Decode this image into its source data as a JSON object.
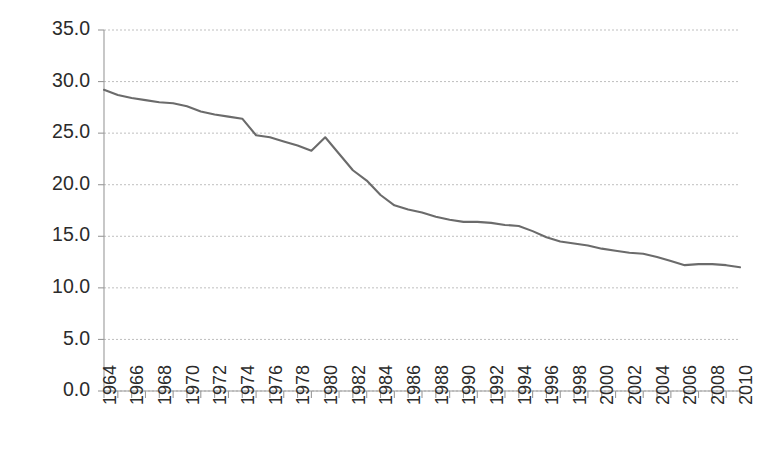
{
  "chart_data": {
    "type": "line",
    "title": "",
    "subtitle": "",
    "xlabel": "",
    "ylabel": "",
    "grid": true,
    "legend": false,
    "legend_position": "none",
    "line_color": "#6b6b6b",
    "xlim": [
      1964,
      2010
    ],
    "ylim": [
      0.0,
      35.0
    ],
    "y_ticks": [
      "0.0",
      "5.0",
      "10.0",
      "15.0",
      "20.0",
      "25.0",
      "30.0",
      "35.0"
    ],
    "y_tick_values": [
      0.0,
      5.0,
      10.0,
      15.0,
      20.0,
      25.0,
      30.0,
      35.0
    ],
    "x_tick_labels": [
      "1964",
      "1966",
      "1968",
      "1970",
      "1972",
      "1974",
      "1976",
      "1978",
      "1980",
      "1982",
      "1984",
      "1986",
      "1988",
      "1990",
      "1992",
      "1994",
      "1996",
      "1998",
      "2000",
      "2002",
      "2004",
      "2006",
      "2008",
      "2010"
    ],
    "x_minor_tick_values": [
      1964,
      1965,
      1966,
      1967,
      1968,
      1969,
      1970,
      1971,
      1972,
      1973,
      1974,
      1975,
      1976,
      1977,
      1978,
      1979,
      1980,
      1981,
      1982,
      1983,
      1984,
      1985,
      1986,
      1987,
      1988,
      1989,
      1990,
      1991,
      1992,
      1993,
      1994,
      1995,
      1996,
      1997,
      1998,
      1999,
      2000,
      2001,
      2002,
      2003,
      2004,
      2005,
      2006,
      2007,
      2008,
      2009,
      2010
    ],
    "x": [
      1964,
      1965,
      1966,
      1967,
      1968,
      1969,
      1970,
      1971,
      1972,
      1973,
      1974,
      1975,
      1976,
      1977,
      1978,
      1979,
      1980,
      1981,
      1982,
      1983,
      1984,
      1985,
      1986,
      1987,
      1988,
      1989,
      1990,
      1991,
      1992,
      1993,
      1994,
      1995,
      1996,
      1997,
      1998,
      1999,
      2000,
      2001,
      2002,
      2003,
      2004,
      2005,
      2006,
      2007,
      2008,
      2009,
      2010
    ],
    "values": [
      29.2,
      28.7,
      28.4,
      28.2,
      28.0,
      27.9,
      27.6,
      27.1,
      26.8,
      26.6,
      26.4,
      24.8,
      24.6,
      24.2,
      23.8,
      23.3,
      24.6,
      23.0,
      21.4,
      20.4,
      19.0,
      18.0,
      17.6,
      17.3,
      16.9,
      16.6,
      16.4,
      16.4,
      16.3,
      16.1,
      16.0,
      15.5,
      14.9,
      14.5,
      14.3,
      14.1,
      13.8,
      13.6,
      13.4,
      13.3,
      13.0,
      12.6,
      12.2,
      12.3,
      12.3,
      12.2,
      12.0
    ],
    "series": [
      {
        "name": "series-1",
        "values": [
          29.2,
          28.7,
          28.4,
          28.2,
          28.0,
          27.9,
          27.6,
          27.1,
          26.8,
          26.6,
          26.4,
          24.8,
          24.6,
          24.2,
          23.8,
          23.3,
          24.6,
          23.0,
          21.4,
          20.4,
          19.0,
          18.0,
          17.6,
          17.3,
          16.9,
          16.6,
          16.4,
          16.4,
          16.3,
          16.1,
          16.0,
          15.5,
          14.9,
          14.5,
          14.3,
          14.1,
          13.8,
          13.6,
          13.4,
          13.3,
          13.0,
          12.6,
          12.2,
          12.3,
          12.3,
          12.2,
          12.0
        ]
      }
    ]
  }
}
